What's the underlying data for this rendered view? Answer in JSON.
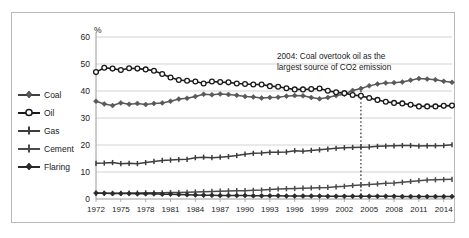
{
  "chart_data": {
    "type": "line",
    "title": "",
    "subtitle": "",
    "xlabel": "",
    "ylabel": "%",
    "ylim": [
      0,
      60
    ],
    "yticks": [
      0,
      10,
      20,
      30,
      40,
      50,
      60
    ],
    "xlim": [
      1972,
      2015
    ],
    "xticks": [
      1972,
      1975,
      1978,
      1981,
      1984,
      1987,
      1990,
      1993,
      1996,
      1999,
      2002,
      2005,
      2008,
      2011,
      2014
    ],
    "grid": "horizontal",
    "legend_position": "left-outside",
    "annotations": [
      {
        "text_line1": "2004: Coal overtook oil as the",
        "text_line2": "largest source of CO2 emission",
        "marker_x": 2004,
        "marker_style": "vertical-dotted-line"
      }
    ],
    "x": [
      1972,
      1973,
      1974,
      1975,
      1976,
      1977,
      1978,
      1979,
      1980,
      1981,
      1982,
      1983,
      1984,
      1985,
      1986,
      1987,
      1988,
      1989,
      1990,
      1991,
      1992,
      1993,
      1994,
      1995,
      1996,
      1997,
      1998,
      1999,
      2000,
      2001,
      2002,
      2003,
      2004,
      2005,
      2006,
      2007,
      2008,
      2009,
      2010,
      2011,
      2012,
      2013,
      2014,
      2015
    ],
    "series": [
      {
        "name": "Coal",
        "marker": "diamond",
        "color": "#595959",
        "values": [
          36.2,
          35.2,
          34.6,
          35.6,
          35.1,
          35.4,
          35.0,
          35.4,
          35.6,
          36.2,
          37.0,
          37.3,
          38.0,
          38.8,
          38.6,
          38.9,
          38.7,
          38.4,
          38.0,
          37.8,
          37.4,
          37.6,
          37.7,
          38.1,
          38.3,
          38.2,
          37.6,
          37.1,
          37.6,
          38.3,
          38.8,
          40.2,
          40.9,
          41.9,
          42.6,
          43.0,
          43.1,
          43.3,
          44.0,
          44.6,
          44.4,
          44.2,
          43.6,
          43.2
        ]
      },
      {
        "name": "Oil",
        "marker": "circle",
        "color": "#1b1b1b",
        "values": [
          47.0,
          48.6,
          48.3,
          47.8,
          48.4,
          48.3,
          48.0,
          47.5,
          46.3,
          45.0,
          44.1,
          43.8,
          43.5,
          42.8,
          43.5,
          43.3,
          43.2,
          42.8,
          42.6,
          42.4,
          42.4,
          41.8,
          41.6,
          41.0,
          40.6,
          40.6,
          40.7,
          40.9,
          40.1,
          39.5,
          39.2,
          38.5,
          38.2,
          37.4,
          36.7,
          36.0,
          35.6,
          35.4,
          34.9,
          34.3,
          34.3,
          34.3,
          34.5,
          34.6
        ]
      },
      {
        "name": "Gas",
        "marker": "cross",
        "color": "#3d3d3d",
        "values": [
          13.2,
          13.3,
          13.5,
          13.1,
          13.2,
          13.1,
          13.5,
          13.9,
          14.3,
          14.4,
          14.6,
          14.7,
          15.3,
          15.5,
          15.3,
          15.5,
          15.7,
          16.1,
          16.6,
          16.9,
          17.0,
          17.3,
          17.3,
          17.4,
          17.9,
          17.7,
          18.0,
          18.2,
          18.5,
          18.8,
          19.0,
          19.1,
          19.2,
          19.3,
          19.5,
          19.6,
          19.7,
          19.8,
          19.8,
          19.6,
          19.7,
          19.7,
          19.8,
          20.1
        ]
      },
      {
        "name": "Cement",
        "marker": "cross",
        "color": "#4a4a4a",
        "values": [
          2.1,
          2.1,
          2.1,
          2.1,
          2.2,
          2.2,
          2.3,
          2.3,
          2.3,
          2.4,
          2.4,
          2.5,
          2.6,
          2.7,
          2.8,
          2.9,
          3.0,
          3.1,
          3.1,
          3.2,
          3.3,
          3.5,
          3.7,
          3.8,
          3.9,
          4.0,
          4.1,
          4.2,
          4.3,
          4.5,
          4.7,
          5.0,
          5.2,
          5.4,
          5.6,
          5.8,
          5.9,
          6.2,
          6.5,
          6.8,
          7.0,
          7.1,
          7.2,
          7.3
        ]
      },
      {
        "name": "Flaring",
        "marker": "diamond",
        "color": "#2b2b2b",
        "values": [
          2.2,
          2.1,
          2.0,
          2.0,
          2.0,
          1.9,
          1.9,
          1.9,
          1.8,
          1.8,
          1.7,
          1.6,
          1.5,
          1.4,
          1.4,
          1.3,
          1.3,
          1.3,
          1.3,
          1.2,
          1.2,
          1.2,
          1.2,
          1.1,
          1.1,
          1.1,
          1.1,
          1.1,
          1.0,
          1.0,
          1.0,
          1.0,
          1.0,
          1.0,
          1.0,
          1.0,
          1.0,
          0.9,
          0.9,
          0.9,
          0.9,
          0.9,
          0.9,
          0.9
        ]
      }
    ]
  },
  "legend": {
    "items": [
      {
        "label": "Coal"
      },
      {
        "label": "Oil"
      },
      {
        "label": "Gas"
      },
      {
        "label": "Cement"
      },
      {
        "label": "Flaring"
      }
    ]
  },
  "axis": {
    "y_unit": "%",
    "y_ticks": [
      "60",
      "50",
      "40",
      "30",
      "20",
      "10",
      "0"
    ],
    "x_ticks": [
      "1972",
      "1975",
      "1978",
      "1981",
      "1984",
      "1987",
      "1990",
      "1993",
      "1996",
      "1999",
      "2002",
      "2005",
      "2008",
      "2011",
      "2014"
    ]
  },
  "annotation": {
    "line1": "2004: Coal overtook oil as the",
    "line2": "largest source of CO2 emission"
  },
  "colors": {
    "grid": "#c8c8c8",
    "axis": "#9a9a9a",
    "frame": "#b9b9b9",
    "text": "#1b1b1b"
  }
}
